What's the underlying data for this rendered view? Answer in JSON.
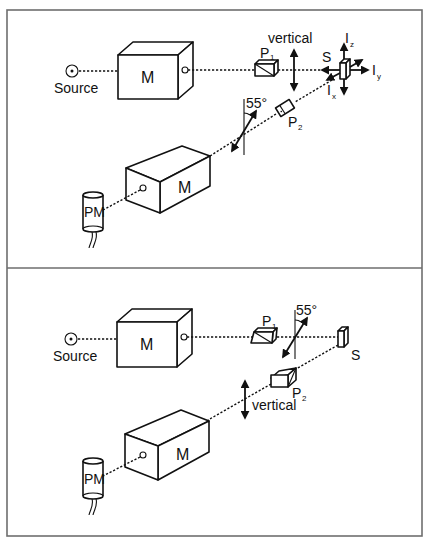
{
  "figure": {
    "panels": [
      {
        "id": "top",
        "source_label": "Source",
        "monochromator_ex_label": "M",
        "polarizer1_label": "P",
        "polarizer1_sub": "1",
        "polarizer1_orientation_label": "vertical",
        "sample_label": "S",
        "intensity_labels": [
          {
            "main": "I",
            "sub": "z"
          },
          {
            "main": "I",
            "sub": "y"
          },
          {
            "main": "I",
            "sub": "x"
          }
        ],
        "polarizer2_label": "P",
        "polarizer2_sub": "2",
        "polarizer2_angle_label": "55°",
        "monochromator_em_label": "M",
        "detector_label": "PM"
      },
      {
        "id": "bottom",
        "source_label": "Source",
        "monochromator_ex_label": "M",
        "polarizer1_label": "P",
        "polarizer1_sub": "1",
        "polarizer1_angle_label": "55°",
        "sample_label": "S",
        "polarizer2_label": "P",
        "polarizer2_sub": "2",
        "polarizer2_orientation_label": "vertical",
        "monochromator_em_label": "M",
        "detector_label": "PM"
      }
    ],
    "colors": {
      "ink": "#111111",
      "frame": "#6e6e6e",
      "background": "#ffffff"
    }
  }
}
